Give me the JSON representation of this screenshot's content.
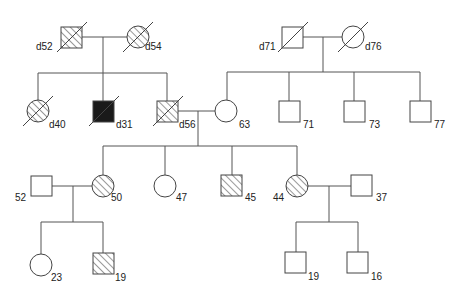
{
  "legend": {
    "square": "male",
    "circle": "female",
    "hatched": "affected (partial)",
    "solid": "affected",
    "slash": "deceased"
  },
  "individuals": [
    {
      "id": "g1_m1",
      "sex": "male",
      "fill": "hatched",
      "deceased": true,
      "label": "d52",
      "x": 61,
      "y": 27
    },
    {
      "id": "g1_f1",
      "sex": "female",
      "fill": "hatched",
      "deceased": true,
      "label": "d54",
      "x": 138,
      "y": 37
    },
    {
      "id": "g1_m2",
      "sex": "male",
      "fill": "none",
      "deceased": true,
      "label": "d71",
      "x": 282,
      "y": 27
    },
    {
      "id": "g1_f2",
      "sex": "female",
      "fill": "none",
      "deceased": true,
      "label": "d76",
      "x": 353,
      "y": 37
    },
    {
      "id": "g2_1",
      "sex": "female",
      "fill": "hatched",
      "deceased": true,
      "label": "d40",
      "x": 38,
      "y": 111
    },
    {
      "id": "g2_2",
      "sex": "male",
      "fill": "solid",
      "deceased": true,
      "label": "d31",
      "x": 93,
      "y": 101
    },
    {
      "id": "g2_3",
      "sex": "male",
      "fill": "hatched",
      "deceased": true,
      "label": "d56",
      "x": 156,
      "y": 101
    },
    {
      "id": "g2_4",
      "sex": "female",
      "fill": "none",
      "deceased": false,
      "label": "63",
      "x": 226,
      "y": 111
    },
    {
      "id": "g2_5",
      "sex": "male",
      "fill": "none",
      "deceased": false,
      "label": "71",
      "x": 278,
      "y": 101
    },
    {
      "id": "g2_6",
      "sex": "male",
      "fill": "none",
      "deceased": false,
      "label": "73",
      "x": 343,
      "y": 101
    },
    {
      "id": "g2_7",
      "sex": "male",
      "fill": "none",
      "deceased": false,
      "label": "77",
      "x": 409,
      "y": 101
    },
    {
      "id": "g3_sp1",
      "sex": "male",
      "fill": "none",
      "deceased": false,
      "label": "52",
      "x": 31,
      "y": 176
    },
    {
      "id": "g3_1",
      "sex": "female",
      "fill": "hatched",
      "deceased": false,
      "label": "50",
      "x": 103,
      "y": 186
    },
    {
      "id": "g3_2",
      "sex": "female",
      "fill": "none",
      "deceased": false,
      "label": "47",
      "x": 165,
      "y": 186
    },
    {
      "id": "g3_3",
      "sex": "male",
      "fill": "hatched",
      "deceased": false,
      "label": "45",
      "x": 221,
      "y": 175
    },
    {
      "id": "g3_4",
      "sex": "female",
      "fill": "hatched",
      "deceased": false,
      "label": "44",
      "x": 297,
      "y": 186
    },
    {
      "id": "g3_sp2",
      "sex": "male",
      "fill": "none",
      "deceased": false,
      "label": "37",
      "x": 351,
      "y": 175
    },
    {
      "id": "g4_1",
      "sex": "female",
      "fill": "none",
      "deceased": false,
      "label": "23",
      "x": 41,
      "y": 265
    },
    {
      "id": "g4_2",
      "sex": "male",
      "fill": "hatched",
      "deceased": false,
      "label": "19",
      "x": 93,
      "y": 253
    },
    {
      "id": "g4_3",
      "sex": "male",
      "fill": "none",
      "deceased": false,
      "label": "19",
      "x": 285,
      "y": 252
    },
    {
      "id": "g4_4",
      "sex": "male",
      "fill": "none",
      "deceased": false,
      "label": "16",
      "x": 347,
      "y": 252
    }
  ]
}
